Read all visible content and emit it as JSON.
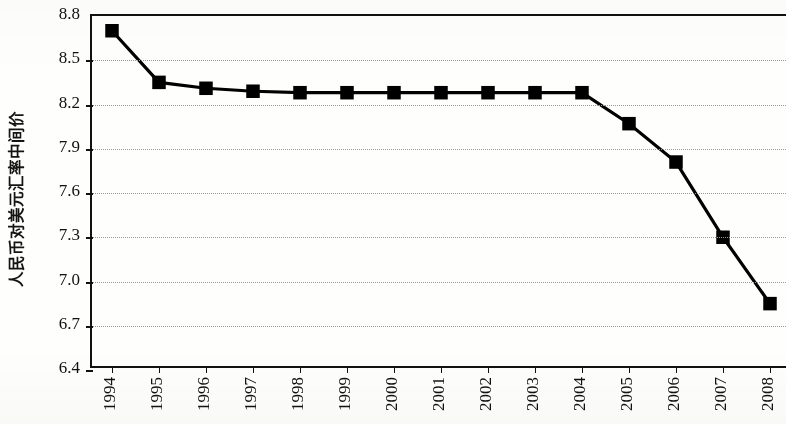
{
  "chart_data": {
    "type": "line",
    "title": "",
    "xlabel": "",
    "ylabel": "人民币对美元汇率中间价",
    "categories": [
      "1994",
      "1995",
      "1996",
      "1997",
      "1998",
      "1999",
      "2000",
      "2001",
      "2002",
      "2003",
      "2004",
      "2005",
      "2006",
      "2007",
      "2008"
    ],
    "values": [
      8.7,
      8.35,
      8.31,
      8.29,
      8.28,
      8.28,
      8.28,
      8.28,
      8.28,
      8.28,
      8.28,
      8.07,
      7.81,
      7.3,
      6.85
    ],
    "series": [
      {
        "name": "人民币对美元汇率中间价",
        "values": [
          8.7,
          8.35,
          8.31,
          8.29,
          8.28,
          8.28,
          8.28,
          8.28,
          8.28,
          8.28,
          8.28,
          8.07,
          7.81,
          7.3,
          6.85
        ]
      }
    ],
    "ylim": [
      6.4,
      8.8
    ],
    "ytick_values": [
      8.8,
      8.5,
      8.2,
      7.9,
      7.6,
      7.3,
      7.0,
      6.7,
      6.4
    ],
    "ytick_labels": [
      "8.8",
      "8.5",
      "8.2",
      "7.9",
      "7.6",
      "7.3",
      "7.0",
      "6.7",
      "6.4"
    ],
    "grid": true,
    "grid_style": "dotted",
    "legend": false,
    "legend_position": "none",
    "marker": "square",
    "marker_color": "#000000",
    "line_color": "#000000",
    "background_color": "#fefefd",
    "annotations": []
  }
}
